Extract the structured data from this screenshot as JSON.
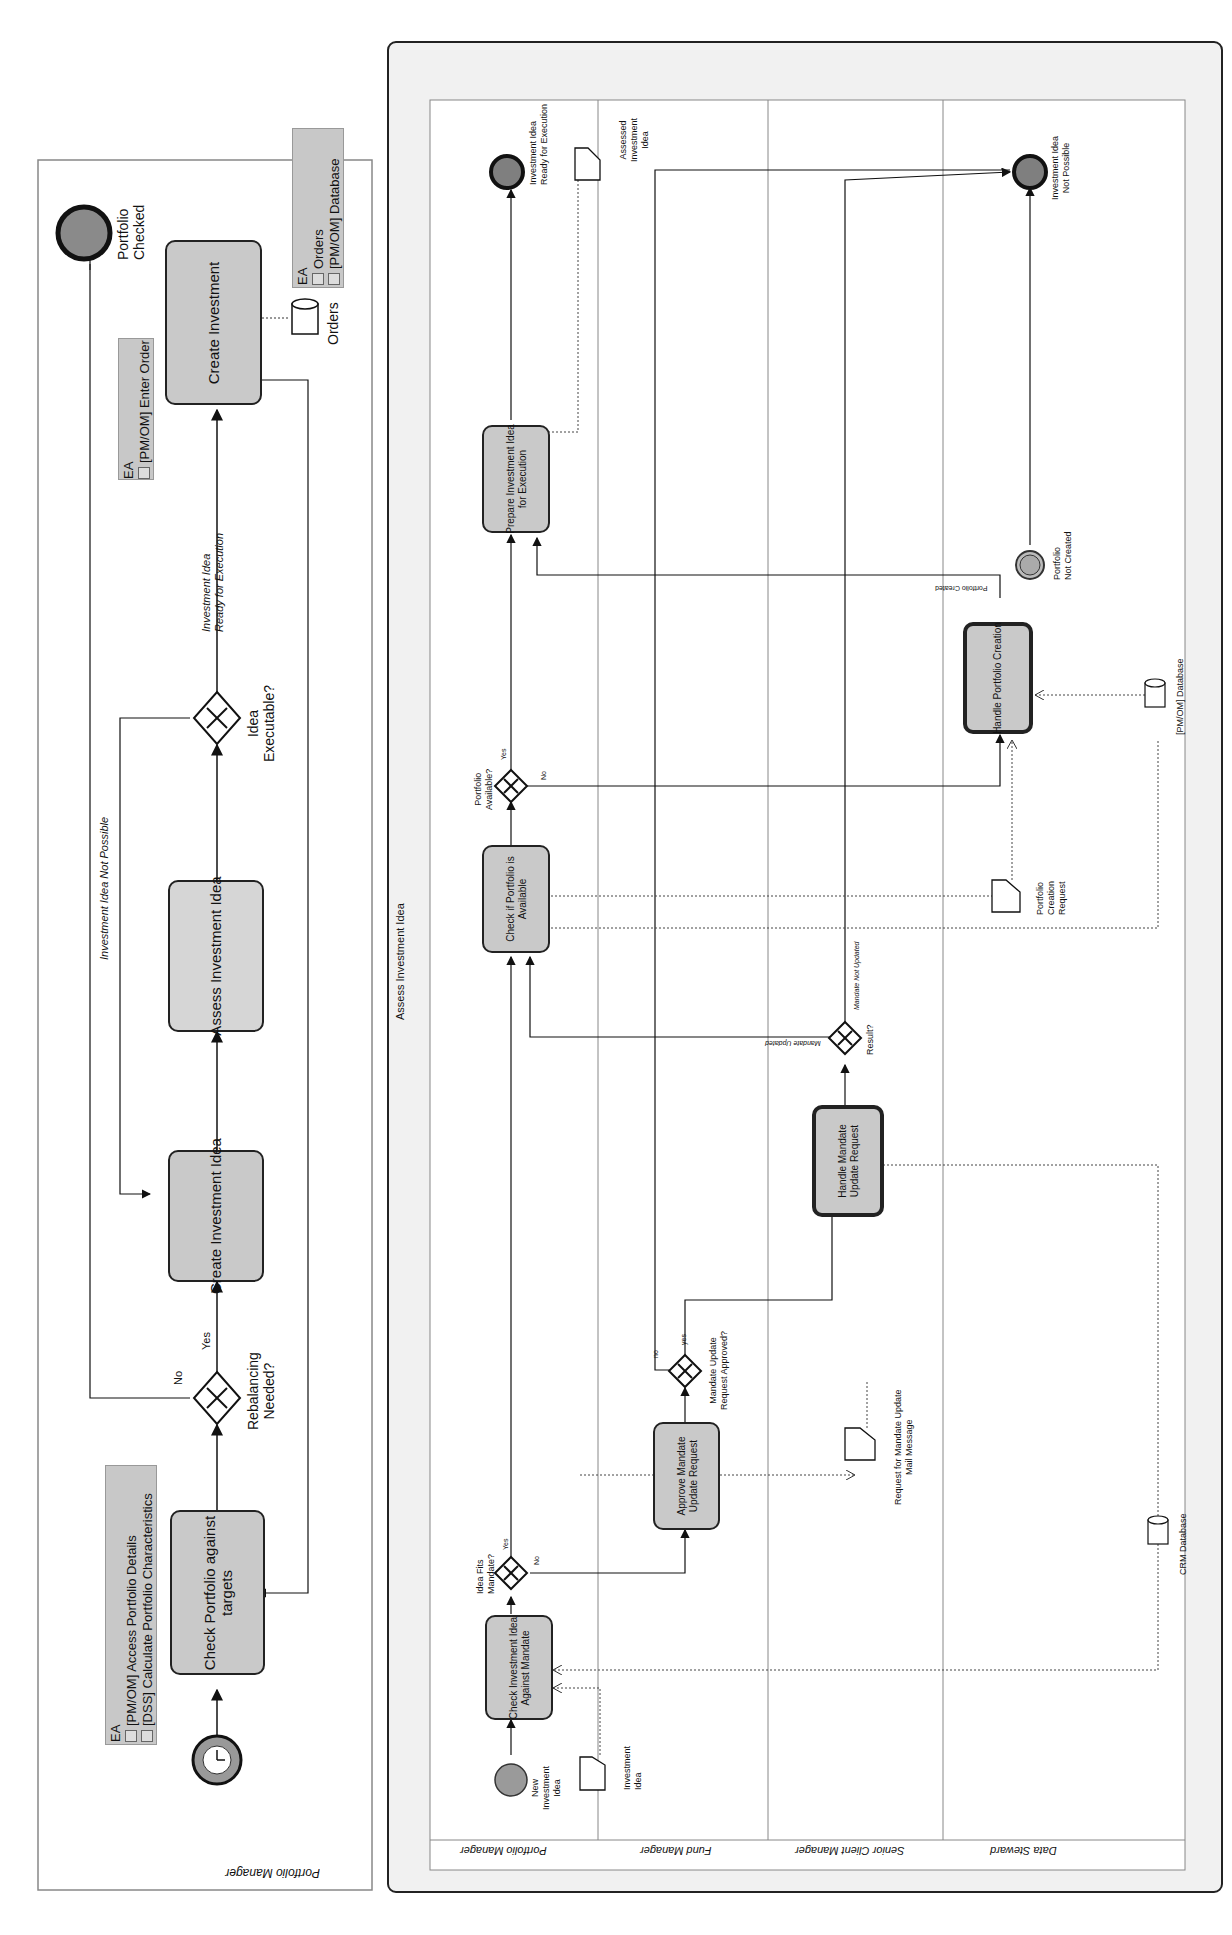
{
  "left_pool": {
    "name": "Portfolio Manager",
    "start_event": {
      "label": "Daily",
      "icon": "timer-icon"
    },
    "tasks": [
      {
        "id": "check_portfolio",
        "line1": "Check Portfolio against",
        "line2": "targets"
      },
      {
        "id": "create_idea",
        "line1": "Create Investment Idea"
      },
      {
        "id": "assess_idea",
        "line1": "Assess Investment Idea"
      },
      {
        "id": "create_investment",
        "line1": "Create Investment"
      }
    ],
    "gateways": [
      {
        "id": "rebalancing",
        "line1": "Rebalancing",
        "line2": "Needed?",
        "yes": "Yes",
        "no": "No"
      },
      {
        "id": "executable",
        "line1": "Idea",
        "line2": "Executable?"
      }
    ],
    "flows": {
      "not_possible": "Investment Idea Not Possible",
      "ready_line1": "Investment Idea",
      "ready_line2": "Ready for Execution"
    },
    "end_event": {
      "line1": "Portfolio",
      "line2": "Checked"
    },
    "data_store": {
      "label": "Orders"
    },
    "ea_boxes": [
      {
        "title": "EA",
        "items": [
          "[PM/OM] Access Portfolio Details",
          "[DSS] Calculate Portfolio Characteristics"
        ]
      },
      {
        "title": "EA",
        "items": [
          "[PM/OM] Enter Order"
        ]
      },
      {
        "title": "EA",
        "items": [
          "Orders",
          "[PM/OM] Database"
        ]
      }
    ]
  },
  "right_pool": {
    "name": "Assess Investment Idea",
    "lanes": [
      "Portfolio Manager",
      "Fund Manager",
      "Senior Client Manager",
      "Data Steward"
    ],
    "start_event": {
      "line1": "New",
      "line2": "Investment",
      "line3": "Idea"
    },
    "tasks": {
      "check_mandate": {
        "line1": "Check Investment Idea",
        "line2": "Against Mandate"
      },
      "check_portfolio": {
        "line1": "Check if Portfolio is",
        "line2": "Available"
      },
      "prepare": {
        "line1": "Prepare Investment Idea",
        "line2": "for Execution"
      },
      "approve": {
        "line1": "Approve Mandate",
        "line2": "Update Request"
      },
      "handle_mandate": {
        "line1": "Handle Mandate",
        "line2": "Update Request"
      },
      "handle_portfolio": {
        "line1": "Handle Portfolio Creation"
      }
    },
    "gateways": {
      "fits": {
        "line1": "Idea Fits",
        "line2": "Mandate?",
        "yes": "Yes",
        "no": "No"
      },
      "available": {
        "line1": "Portfolio",
        "line2": "Available?",
        "yes": "Yes",
        "no": "No"
      },
      "approved": {
        "line1": "Mandate Update",
        "line2": "Request Approved?",
        "yes": "yes",
        "no": "no"
      },
      "result": {
        "line1": "Result?",
        "updated": "Mandate Updated",
        "not_updated": "Mandate Not Updated"
      }
    },
    "flows": {
      "portfolio_created": "Portfolio Created"
    },
    "boundary_event": {
      "line1": "Portfolio",
      "line2": "Not Created"
    },
    "end_events": {
      "ready": {
        "line1": "Investment Idea",
        "line2": "Ready for Execution"
      },
      "not_possible": {
        "line1": "Investment Idea",
        "line2": "Not Possible"
      }
    },
    "data_objects": {
      "investment_idea": {
        "line1": "Investment",
        "line2": "Idea"
      },
      "assessed": {
        "line1": "Assessed",
        "line2": "Investment",
        "line3": "Idea"
      },
      "mail": {
        "line1": "Request for Mandate Update",
        "line2": "Mail Message"
      },
      "creation_request": {
        "line1": "Portfolio",
        "line2": "Creation",
        "line3": "Request"
      }
    },
    "data_stores": {
      "pmom": {
        "label": "[PM/OM] Database"
      },
      "crm": {
        "label": "CRM Database"
      }
    }
  }
}
